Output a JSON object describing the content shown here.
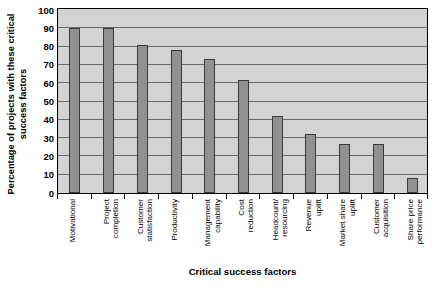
{
  "chart_data": {
    "type": "bar",
    "title": "",
    "xlabel": "Critical success factors",
    "ylabel": "Percentage of projects with these critical success factors",
    "ylabel_lines": [
      "Percentage of projects with these critical",
      "success factors"
    ],
    "ylim": [
      0,
      100
    ],
    "ytick_step": 10,
    "yticks": [
      100,
      90,
      80,
      70,
      60,
      50,
      40,
      30,
      20,
      10,
      0
    ],
    "grid": true,
    "grid_axis": "y",
    "legend": "none",
    "categories": [
      "Motivational",
      "Project completion",
      "Customer statisfaction",
      "Productivity",
      "Management capability",
      "Cost reduction",
      "Headcount/ resourcing",
      "Revenue uplift",
      "Market share uplift",
      "Customer acquisition",
      "Share price performance"
    ],
    "category_lines": [
      [
        "Motivational"
      ],
      [
        "Project",
        "completion"
      ],
      [
        "Customer",
        "statisfaction"
      ],
      [
        "Productivity"
      ],
      [
        "Management",
        "capability"
      ],
      [
        "Cost",
        "reduction"
      ],
      [
        "Headcount/",
        "resourcing"
      ],
      [
        "Revenue",
        "uplift"
      ],
      [
        "Market share",
        "uplift"
      ],
      [
        "Customer",
        "acquisition"
      ],
      [
        "Share price",
        "performance"
      ]
    ],
    "values": [
      90,
      90,
      81,
      78,
      73,
      62,
      42,
      32,
      27,
      27,
      8
    ],
    "colors": {
      "bar_fill": "#919191",
      "bar_border": "#3a3a3a",
      "plot_background": "#d3d3d3",
      "gridline": "#6a6a6a",
      "axis": "#000000",
      "text": "#000000"
    }
  }
}
